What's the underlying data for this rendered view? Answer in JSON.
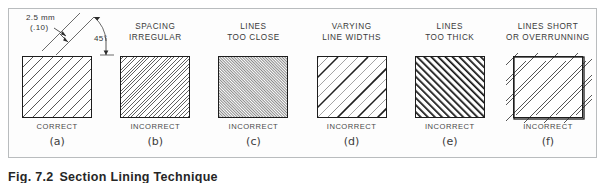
{
  "figure": {
    "caption_number": "Fig. 7.2",
    "caption_title": "Section Lining Technique",
    "frame_color": "#b9bcbe",
    "line_color": "#1d1d1d",
    "background": "#fdfdfd"
  },
  "annotation": {
    "spacing_metric": "2.5 mm",
    "spacing_imperial": "(.10)",
    "angle": "45°"
  },
  "panels": [
    {
      "key": "(a)",
      "heading": "",
      "verdict": "CORRECT",
      "style": "uniform",
      "description": "evenly spaced thin 45 degree section lines"
    },
    {
      "key": "(b)",
      "heading": "SPACING\nIRREGULAR",
      "verdict": "INCORRECT",
      "style": "irregular",
      "description": "section lines spaced unevenly"
    },
    {
      "key": "(c)",
      "heading": "LINES\nTOO  CLOSE",
      "verdict": "INCORRECT",
      "style": "too-close",
      "description": "section lines crowded together"
    },
    {
      "key": "(d)",
      "heading": "VARYING\nLINE  WIDTHS",
      "verdict": "INCORRECT",
      "style": "varying-width",
      "description": "section lines drawn with inconsistent weights"
    },
    {
      "key": "(e)",
      "heading": "LINES\nTOO  THICK",
      "verdict": "INCORRECT",
      "style": "too-thick",
      "description": "section lines drawn too heavy"
    },
    {
      "key": "(f)",
      "heading": "LINES SHORT\nOR OVERRUNNING",
      "verdict": "INCORRECT",
      "style": "short-overrun",
      "description": "section lines stop short of or extend past the outline"
    }
  ]
}
